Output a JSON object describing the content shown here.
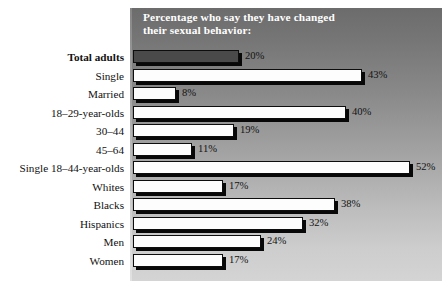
{
  "chart_data": {
    "type": "bar",
    "orientation": "horizontal",
    "title": "Percentage who say they have changed\ntheir sexual behavior:",
    "xlabel": "",
    "ylabel": "",
    "xlim": [
      0,
      57
    ],
    "grid": false,
    "legend": "none",
    "value_suffix": "%",
    "categories": [
      "Total adults",
      "Single",
      "Married",
      "18–29-year-olds",
      "30–44",
      "45–64",
      "Single 18–44-year-olds",
      "Whites",
      "Blacks",
      "Hispanics",
      "Men",
      "Women"
    ],
    "values": [
      20,
      43,
      8,
      40,
      19,
      11,
      52,
      17,
      38,
      32,
      24,
      17
    ],
    "value_labels": [
      "20%",
      "43%",
      "8%",
      "40%",
      "19%",
      "11%",
      "52%",
      "17%",
      "38%",
      "32%",
      "24%",
      "17%"
    ],
    "emphasis_index": 0,
    "series": [
      {
        "name": "Percentage who say they have changed their sexual behavior",
        "values": [
          20,
          43,
          8,
          40,
          19,
          11,
          52,
          17,
          38,
          32,
          24,
          17
        ]
      }
    ]
  },
  "colors": {
    "panel_top": "#6c6c6c",
    "panel_bottom": "#d4d4d4",
    "bar_fill": "#fdfdfd",
    "bar_fill_emphasis": "#4a4a4a",
    "bar_outline": "#0d0d0d",
    "bar_shadow": "#080808",
    "title_text": "#ffffff",
    "label_text": "#111111",
    "page_background": "#ffffff"
  }
}
